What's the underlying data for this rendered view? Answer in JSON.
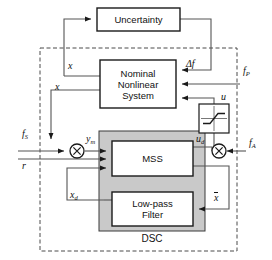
{
  "diagram": {
    "title_block": "Uncertainty",
    "blocks": [
      {
        "id": "uncertainty",
        "label": "Uncertainty",
        "x": 97,
        "y": 8,
        "w": 83,
        "h": 23,
        "fill": "#ffffff"
      },
      {
        "id": "nominal-nonlinear-system",
        "label_lines": [
          "Nominal",
          "Nonlinear",
          "System"
        ],
        "x": 100,
        "y": 60,
        "w": 76,
        "h": 48,
        "fill": "#ffffff"
      },
      {
        "id": "saturation",
        "label": "",
        "x": 199,
        "y": 104,
        "w": 30,
        "h": 29,
        "fill": "#ffffff"
      },
      {
        "id": "mss",
        "label": "MSS",
        "x": 112,
        "y": 141,
        "w": 81,
        "h": 35,
        "fill": "#ffffff"
      },
      {
        "id": "low-pass-filter",
        "label_lines": [
          "Low-pass",
          "Filter"
        ],
        "x": 112,
        "y": 192,
        "w": 81,
        "h": 34,
        "fill": "#ffffff"
      }
    ],
    "dsc_region": {
      "label": "DSC",
      "x": 99,
      "y": 131,
      "w": 106,
      "h": 100,
      "fill": "#c9c9c9"
    },
    "outer_dashed": {
      "x": 40,
      "y": 48,
      "w": 197,
      "h": 203
    },
    "multipliers": [
      {
        "id": "mixer-input",
        "glyph": "×",
        "cx": 77,
        "cy": 151,
        "r": 7
      },
      {
        "id": "mixer-output",
        "glyph": "×",
        "cx": 219,
        "cy": 151,
        "r": 7
      }
    ],
    "signals": [
      {
        "id": "delta-f",
        "text": "Δf",
        "x": 186,
        "y": 59
      },
      {
        "id": "f-p",
        "text": "f",
        "sub": "P",
        "x": 243,
        "y": 66
      },
      {
        "id": "u",
        "text": "u",
        "x": 221,
        "y": 92
      },
      {
        "id": "x-upper",
        "text": "x",
        "x": 68,
        "y": 61
      },
      {
        "id": "x-lower",
        "text": "x",
        "x": 55,
        "y": 82
      },
      {
        "id": "f-s",
        "text": "f",
        "sub": "S",
        "x": 22,
        "y": 129
      },
      {
        "id": "y-m",
        "text": "y",
        "sub": "m",
        "x": 86,
        "y": 134
      },
      {
        "id": "r",
        "text": "r",
        "x": 22,
        "y": 161
      },
      {
        "id": "u-d",
        "text": "u",
        "sub": "d",
        "x": 196,
        "y": 134
      },
      {
        "id": "f-a",
        "text": "f",
        "sub": "A",
        "x": 249,
        "y": 138
      },
      {
        "id": "x-d",
        "text": "x",
        "sub": "d",
        "x": 70,
        "y": 190
      },
      {
        "id": "x-bar",
        "text": "x",
        "overline": true,
        "x": 214,
        "y": 193
      }
    ],
    "colors": {
      "stroke": "#1a1a1a",
      "block_fill": "#ffffff",
      "dsc_fill": "#c9c9c9",
      "background": "#ffffff",
      "wire": "#555555"
    }
  }
}
